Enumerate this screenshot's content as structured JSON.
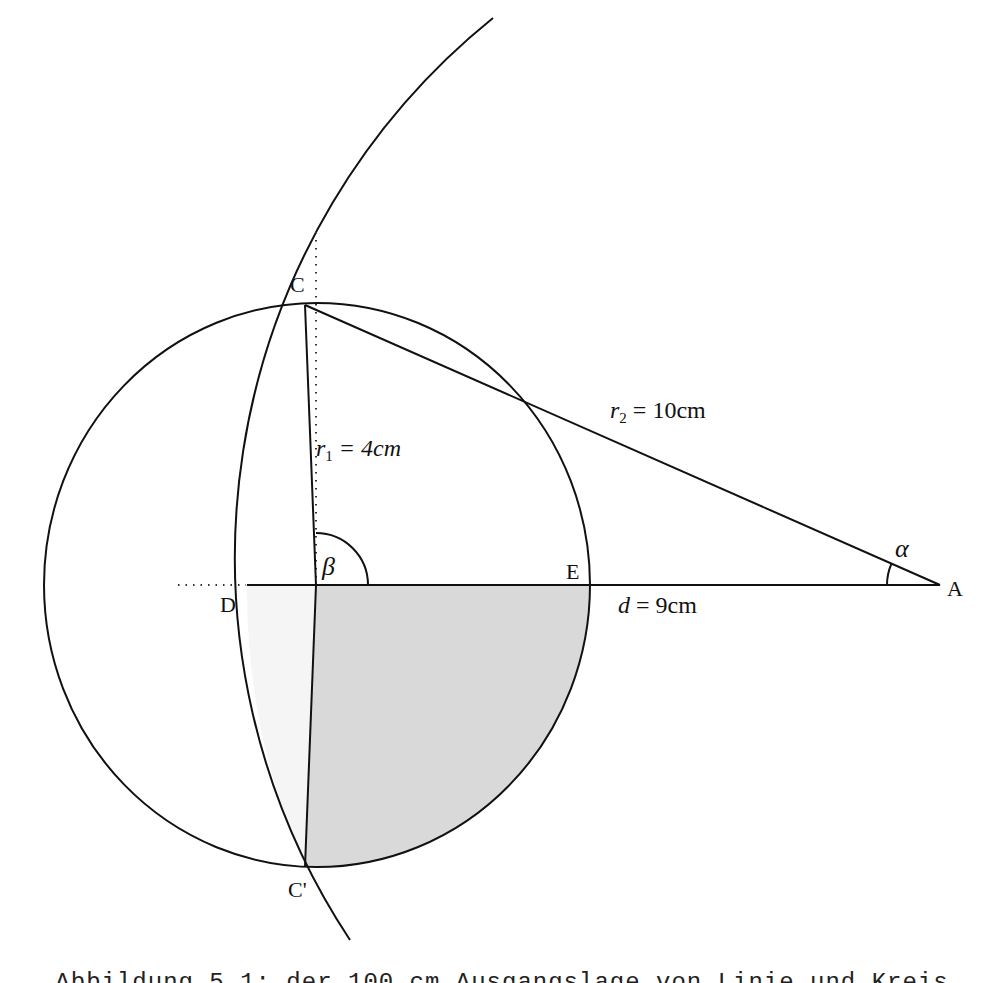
{
  "diagram": {
    "points": {
      "C": "C",
      "C_prime": "C'",
      "D": "D",
      "E": "E",
      "A": "A"
    },
    "angles": {
      "alpha": "α",
      "beta": "β"
    },
    "measures": {
      "r1_var": "r",
      "r1_sub": "1",
      "r1_eq": " = 4cm",
      "r2_var": "r",
      "r2_sub": "2",
      "r2_eq": " = 10cm",
      "d_var": "d",
      "d_eq": " = 9cm"
    },
    "colors": {
      "stroke": "#111111",
      "shade_dark": "#d9d9d9",
      "shade_light": "#f5f5f5"
    }
  },
  "caption": "Abbildung 5.1: der 100 cm Ausgangslage von Linie und Kreis"
}
